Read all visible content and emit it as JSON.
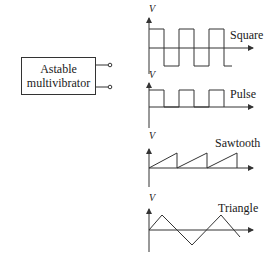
{
  "block": {
    "line1": "Astable",
    "line2": "multivibrator"
  },
  "axis_label": "V",
  "waveforms": [
    {
      "name": "square",
      "label": "Square"
    },
    {
      "name": "pulse",
      "label": "Pulse"
    },
    {
      "name": "sawtooth",
      "label": "Sawtooth"
    },
    {
      "name": "triangle",
      "label": "Triangle"
    }
  ],
  "colors": {
    "line": "#333333",
    "background": "#ffffff"
  }
}
